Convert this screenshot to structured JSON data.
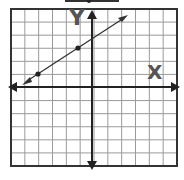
{
  "graph": {
    "x_axis_label": "X",
    "y_axis_label": "Y",
    "grid": {
      "cols": 12,
      "rows": 12
    },
    "origin_cell": {
      "col": 6,
      "row": 6
    },
    "points": [
      {
        "x": -4,
        "y": 1
      },
      {
        "x": -1,
        "y": 3
      }
    ],
    "line": {
      "slope": "2/3",
      "through": [
        [
          -4,
          1
        ],
        [
          -1,
          3
        ]
      ],
      "arrows": "both"
    },
    "colors": {
      "grid": "#9a9a9a",
      "border": "#333333",
      "axis": "#222222",
      "line": "#333333",
      "label": "#555555"
    }
  },
  "chart_data": {
    "type": "line",
    "title": "",
    "xlabel": "X",
    "ylabel": "Y",
    "x": [
      -4,
      -1
    ],
    "y": [
      1,
      3
    ],
    "xlim": [
      -6,
      6
    ],
    "ylim": [
      -6,
      6
    ],
    "grid": true,
    "series": [
      {
        "name": "line",
        "points": [
          [
            -4,
            1
          ],
          [
            -1,
            3
          ]
        ],
        "extends": "both directions"
      }
    ]
  }
}
